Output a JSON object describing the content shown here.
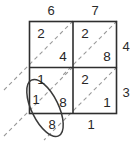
{
  "diagram": {
    "type": "lattice-multiplication",
    "multiplicand_digits": [
      "6",
      "7"
    ],
    "multiplier_digits": [
      "4",
      "3"
    ],
    "cells": [
      {
        "id": "cell-r1c1",
        "row": 1,
        "col": 1,
        "upper": "2",
        "lower": "4"
      },
      {
        "id": "cell-r1c2",
        "row": 1,
        "col": 2,
        "upper": "2",
        "lower": "8"
      },
      {
        "id": "cell-r2c1",
        "row": 2,
        "col": 1,
        "upper": "1",
        "lower": "8"
      },
      {
        "id": "cell-r2c2",
        "row": 2,
        "col": 2,
        "upper": "2",
        "lower": "1"
      }
    ],
    "top_labels": [
      {
        "id": "top-label-1",
        "value": "6"
      },
      {
        "id": "top-label-2",
        "value": "7"
      }
    ],
    "right_labels": [
      {
        "id": "right-label-1",
        "value": "4"
      },
      {
        "id": "right-label-2",
        "value": "3"
      }
    ],
    "result_digits": [
      {
        "id": "result-digit-left",
        "value": "1",
        "circled": true
      },
      {
        "id": "result-digit-bottom-left",
        "value": "8",
        "circled": true
      },
      {
        "id": "result-digit-bottom-right",
        "value": "1",
        "circled": false
      }
    ],
    "annotation": {
      "id": "highlight-ellipse",
      "shape": "ellipse",
      "encircles": [
        "1",
        "8"
      ]
    },
    "colors": {
      "grid_line": "#2e2e2e",
      "diagonal_line": "#8f8f8f",
      "ellipse_line": "#3a3a3a",
      "text": "#262626",
      "background": "#ffffff"
    }
  }
}
